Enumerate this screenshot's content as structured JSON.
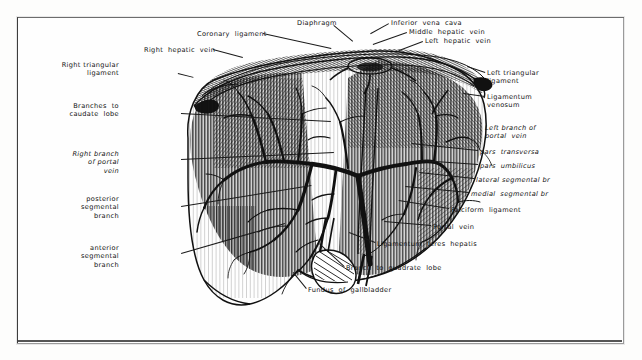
{
  "figure": {
    "kind": "anatomical-engraving",
    "frame_color": "#9a9a9a",
    "ink_color": "#111111",
    "paper_color": "#fefefe"
  },
  "labels": [
    {
      "id": "coronary-ligament",
      "text": "Coronary  ligament",
      "x": 196,
      "y": 29,
      "align": "left",
      "italic": false
    },
    {
      "id": "diaphragm",
      "text": "Diaphragm",
      "x": 296,
      "y": 18,
      "align": "left",
      "italic": false
    },
    {
      "id": "inferior-vena-cava",
      "text": "Inferior  vena  cava",
      "x": 390,
      "y": 18,
      "align": "left",
      "italic": false
    },
    {
      "id": "middle-hepatic-vein",
      "text": "Middle  hepatic  vein",
      "x": 408,
      "y": 27,
      "align": "left",
      "italic": false
    },
    {
      "id": "left-hepatic-vein",
      "text": "Left  hepatic  vein",
      "x": 424,
      "y": 36,
      "align": "left",
      "italic": false
    },
    {
      "id": "right-hepatic-vein",
      "text": "Right  hepatic  vein",
      "x": 143,
      "y": 45,
      "align": "left",
      "italic": false
    },
    {
      "id": "right-triangular-ligament",
      "text": "Right triangular\nligament",
      "x": 118,
      "y": 60,
      "align": "right",
      "italic": false
    },
    {
      "id": "left-triangular-ligament",
      "text": "Left triangular\nligament",
      "x": 486,
      "y": 68,
      "align": "left",
      "italic": false
    },
    {
      "id": "ligamentum-venosum",
      "text": "Ligamentum\nvenosum",
      "x": 486,
      "y": 92,
      "align": "left",
      "italic": false
    },
    {
      "id": "branches-to-caudate-lobe",
      "text": "Branches  to\ncaudate  lobe",
      "x": 118,
      "y": 101,
      "align": "right",
      "italic": false
    },
    {
      "id": "left-branch-of-portal-vein",
      "text": "Left branch of\nportal  vein",
      "x": 484,
      "y": 123,
      "align": "left",
      "italic": true
    },
    {
      "id": "right-branch-of-portal-vein",
      "text": "Right branch\nof portal\nvein",
      "x": 118,
      "y": 149,
      "align": "right",
      "italic": true
    },
    {
      "id": "pars-transversa",
      "text": "pars  transversa",
      "x": 479,
      "y": 147,
      "align": "left",
      "italic": true
    },
    {
      "id": "pars-umbilicus",
      "text": "pars  umbilicus",
      "x": 479,
      "y": 161,
      "align": "left",
      "italic": true
    },
    {
      "id": "lateral-segmental-br",
      "text": "lateral segmental br",
      "x": 475,
      "y": 175,
      "align": "left",
      "italic": true
    },
    {
      "id": "medial-segmental-br",
      "text": "medial  segmental br",
      "x": 470,
      "y": 189,
      "align": "left",
      "italic": true
    },
    {
      "id": "posterior-segmental-branch",
      "text": "posterior\nsegmental\nbranch",
      "x": 118,
      "y": 194,
      "align": "right",
      "italic": false
    },
    {
      "id": "falciform-ligament",
      "text": "Falciform  ligament",
      "x": 450,
      "y": 205,
      "align": "left",
      "italic": false
    },
    {
      "id": "portal-vein",
      "text": "Portal  vein",
      "x": 432,
      "y": 222,
      "align": "left",
      "italic": false
    },
    {
      "id": "anterior-segmental-branch",
      "text": "anterior\nsegmental\nbranch",
      "x": 118,
      "y": 243,
      "align": "right",
      "italic": false
    },
    {
      "id": "ligamentum-teres-hepatis",
      "text": "Ligamentum  teres  hepatis",
      "x": 376,
      "y": 239,
      "align": "left",
      "italic": false
    },
    {
      "id": "branch-to-quadrate-lobe",
      "text": "Branch  to  quadrate  lobe",
      "x": 345,
      "y": 263,
      "align": "left",
      "italic": false
    },
    {
      "id": "fundus-of-gallbladder",
      "text": "Fundus  of  gallbladder",
      "x": 307,
      "y": 285,
      "align": "left",
      "italic": false
    }
  ],
  "leaders": [
    {
      "id": "leader-coronary-ligament",
      "x1": 262,
      "y1": 32,
      "x2": 330,
      "y2": 47
    },
    {
      "id": "leader-diaphragm",
      "x1": 333,
      "y1": 24,
      "x2": 352,
      "y2": 40
    },
    {
      "id": "leader-inferior-vena-cava",
      "x1": 388,
      "y1": 23,
      "x2": 370,
      "y2": 33
    },
    {
      "id": "leader-middle-hepatic-vein",
      "x1": 406,
      "y1": 32,
      "x2": 372,
      "y2": 44
    },
    {
      "id": "leader-left-hepatic-vein",
      "x1": 422,
      "y1": 41,
      "x2": 398,
      "y2": 50
    },
    {
      "id": "leader-right-hepatic-vein",
      "x1": 212,
      "y1": 48,
      "x2": 242,
      "y2": 56
    },
    {
      "id": "leader-right-triangular-ligament",
      "x1": 177,
      "y1": 72,
      "x2": 193,
      "y2": 76
    },
    {
      "id": "leader-left-triangular-ligament",
      "x1": 484,
      "y1": 72,
      "x2": 466,
      "y2": 66
    },
    {
      "id": "leader-ligamentum-venosum",
      "x1": 484,
      "y1": 96,
      "x2": 462,
      "y2": 93
    },
    {
      "id": "leader-branches-to-caudate-lobe",
      "x1": 180,
      "y1": 112,
      "x2": 330,
      "y2": 120
    },
    {
      "id": "leader-pars-transversa",
      "x1": 477,
      "y1": 150,
      "x2": 410,
      "y2": 143
    },
    {
      "id": "leader-pars-umbilicus",
      "x1": 477,
      "y1": 164,
      "x2": 420,
      "y2": 160
    },
    {
      "id": "leader-lateral-segmental-br",
      "x1": 473,
      "y1": 178,
      "x2": 418,
      "y2": 172
    },
    {
      "id": "leader-medial-segmental-br",
      "x1": 468,
      "y1": 192,
      "x2": 404,
      "y2": 186
    },
    {
      "id": "leader-right-branch-portal-vein",
      "x1": 180,
      "y1": 158,
      "x2": 333,
      "y2": 151
    },
    {
      "id": "leader-posterior-segmental",
      "x1": 180,
      "y1": 205,
      "x2": 310,
      "y2": 184
    },
    {
      "id": "leader-anterior-segmental",
      "x1": 180,
      "y1": 252,
      "x2": 284,
      "y2": 222
    },
    {
      "id": "leader-falciform-ligament",
      "x1": 448,
      "y1": 208,
      "x2": 398,
      "y2": 200
    },
    {
      "id": "leader-portal-vein",
      "x1": 430,
      "y1": 225,
      "x2": 383,
      "y2": 221
    },
    {
      "id": "leader-ligamentum-teres-hepatis",
      "x1": 374,
      "y1": 242,
      "x2": 348,
      "y2": 232
    },
    {
      "id": "leader-branch-to-quadrate-lobe",
      "x1": 343,
      "y1": 266,
      "x2": 318,
      "y2": 243
    },
    {
      "id": "leader-fundus-of-gallbladder",
      "x1": 305,
      "y1": 288,
      "x2": 292,
      "y2": 272
    }
  ]
}
